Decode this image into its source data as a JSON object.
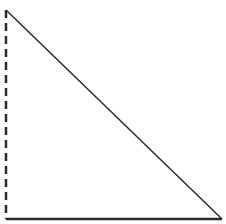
{
  "diagram": {
    "type": "right-triangle",
    "background": "#ffffff",
    "stroke_color": "#2b2b2b",
    "vertices": {
      "top": [
        6,
        10
      ],
      "bottom_left": [
        6,
        219
      ],
      "bottom_right": [
        222,
        219
      ]
    },
    "edges": [
      {
        "name": "vertical-leg",
        "from": "top",
        "to": "bottom_left",
        "style": "dashed",
        "width": 2.5,
        "dash": "8,5"
      },
      {
        "name": "horizontal-leg",
        "from": "bottom_left",
        "to": "bottom_right",
        "style": "solid",
        "width": 2.5
      },
      {
        "name": "hypotenuse",
        "from": "top",
        "to": "bottom_right",
        "style": "solid",
        "width": 1.5
      }
    ]
  }
}
